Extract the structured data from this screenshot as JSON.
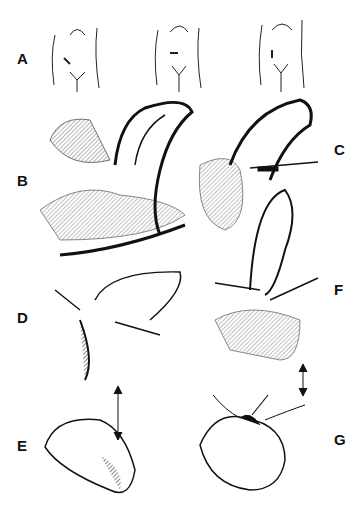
{
  "figure": {
    "panels": [
      {
        "id": "A",
        "label": "A",
        "description": "Three abdomen outlines showing incision sites"
      },
      {
        "id": "B",
        "label": "B",
        "description": "Exposed organ loop through incision"
      },
      {
        "id": "C",
        "label": "C",
        "description": "Organ clamped with forceps"
      },
      {
        "id": "D",
        "label": "D",
        "description": "Clamp applied at base"
      },
      {
        "id": "E",
        "label": "E",
        "description": "Result after closure"
      },
      {
        "id": "F",
        "label": "F",
        "description": "Alternative clamping technique"
      },
      {
        "id": "G",
        "label": "G",
        "description": "Suture ligation result"
      }
    ],
    "colors": {
      "ink": "#111111",
      "background": "#ffffff"
    }
  }
}
